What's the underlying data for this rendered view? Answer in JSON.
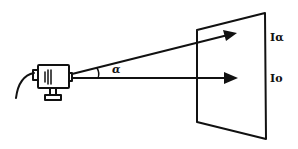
{
  "diagram": {
    "angle_label": "α",
    "labels": {
      "upper_ray_intensity": "Iα",
      "center_ray_intensity": "Io"
    },
    "colors": {
      "ink": "#111111",
      "background": "#ffffff"
    }
  }
}
